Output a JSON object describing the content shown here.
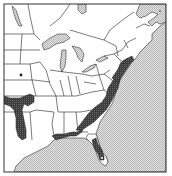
{
  "map": {
    "type": "species-range-map",
    "region": "Eastern North America",
    "colors": {
      "land": "#ffffff",
      "water": "#d4d4d4",
      "range": "#4a4a4a",
      "borders": "#222222",
      "frame": "#333333"
    },
    "legend": {
      "range_label": "",
      "water_label": ""
    },
    "range_areas": [
      "Texas/Oklahoma interior",
      "Gulf Coast (Louisiana to Florida panhandle)",
      "Florida peninsula",
      "Atlantic Coastal Plain (Georgia to Virginia)",
      "Mid-Atlantic coast (Delaware Bay to Long Island)"
    ],
    "outlier_points": [
      "Kansas/Nebraska point"
    ]
  }
}
